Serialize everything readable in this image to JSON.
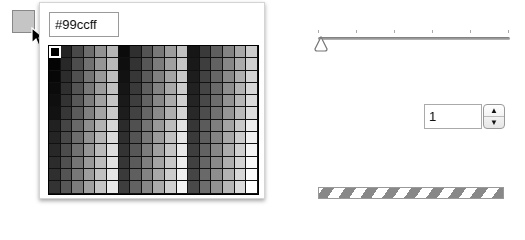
{
  "color_picker": {
    "current_swatch_color": "#99ccff",
    "hex_value": "#99ccff",
    "grid": {
      "columns": 18,
      "rows": 12,
      "selected_index": 0,
      "palette": "web-safe-216"
    }
  },
  "slider": {
    "value": 0,
    "min": 0,
    "max": 5,
    "tick_count": 6
  },
  "stepper": {
    "value": "1",
    "up_icon": "▲",
    "down_icon": "▼"
  },
  "progress": {
    "state": "indeterminate"
  }
}
